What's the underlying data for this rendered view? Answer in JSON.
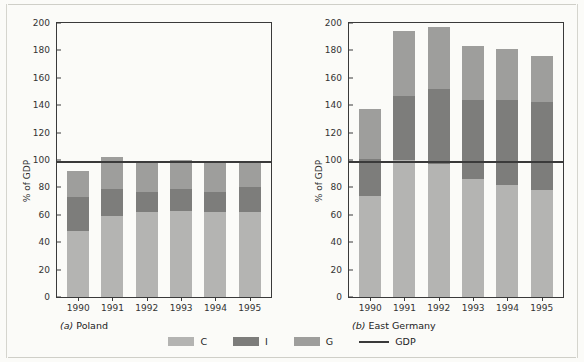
{
  "chart_data": {
    "type": "bar",
    "title": "",
    "subtitle": "",
    "stacked": true,
    "categories": [
      "1990",
      "1991",
      "1992",
      "1993",
      "1994",
      "1995"
    ],
    "ylabel": "% of GDP",
    "xlabel": "",
    "ylim": [
      0,
      200
    ],
    "ytick_step": 20,
    "yticks": [
      0,
      20,
      40,
      60,
      80,
      100,
      120,
      140,
      160,
      180,
      200
    ],
    "grid": false,
    "legend_position": "bottom-center",
    "legend": [
      {
        "key": "C",
        "label": "C",
        "color": "#b4b4b2",
        "marker": "swatch"
      },
      {
        "key": "I",
        "label": "I",
        "color": "#7d7d7b",
        "marker": "swatch"
      },
      {
        "key": "G",
        "label": "G",
        "color": "#9e9e9c",
        "marker": "swatch"
      },
      {
        "key": "GDP",
        "label": "GDP",
        "color": "#3a3a3a",
        "marker": "line"
      }
    ],
    "reference_line": {
      "label": "GDP",
      "value": 100,
      "color": "#3a3a3a"
    },
    "panels": [
      {
        "id": "poland",
        "caption_prefix": "(a)",
        "caption": "Poland",
        "caption_full": "(a)  Poland",
        "series": [
          {
            "name": "C",
            "color": "#b4b4b2",
            "values": [
              48,
              59,
              62,
              63,
              62,
              62
            ]
          },
          {
            "name": "I",
            "color": "#7d7d7b",
            "values": [
              25,
              20,
              15,
              16,
              15,
              18
            ]
          },
          {
            "name": "G",
            "color": "#9e9e9c",
            "values": [
              19,
              23,
              22,
              21,
              21,
              18
            ]
          }
        ],
        "totals": [
          92,
          102,
          99,
          100,
          98,
          98
        ],
        "gdp": [
          100,
          100,
          100,
          100,
          100,
          100
        ]
      },
      {
        "id": "east-germany",
        "caption_prefix": "(b)",
        "caption": "East Germany",
        "caption_full": "(b)  East Germany",
        "series": [
          {
            "name": "C",
            "color": "#b4b4b2",
            "values": [
              74,
              100,
              97,
              86,
              82,
              78
            ]
          },
          {
            "name": "I",
            "color": "#7d7d7b",
            "values": [
              27,
              47,
              55,
              58,
              62,
              64
            ]
          },
          {
            "name": "G",
            "color": "#9e9e9c",
            "values": [
              36,
              47,
              45,
              39,
              37,
              34
            ]
          }
        ],
        "totals": [
          137,
          194,
          197,
          183,
          181,
          176
        ],
        "gdp": [
          100,
          100,
          100,
          100,
          100,
          100
        ]
      }
    ]
  }
}
